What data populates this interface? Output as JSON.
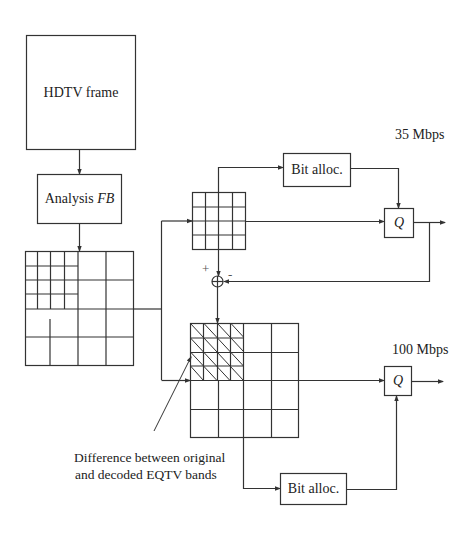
{
  "diagram": {
    "nodes": {
      "hdtv_frame": {
        "label": "HDTV frame"
      },
      "analysis_fb": {
        "label_prefix": "Analysis ",
        "label_math": "FB"
      },
      "bit_alloc_top": {
        "label": "Bit alloc."
      },
      "bit_alloc_bottom": {
        "label": "Bit alloc."
      },
      "q_top": {
        "label": "Q"
      },
      "q_bottom": {
        "label": "Q"
      },
      "sum_junction": {
        "plus": "+",
        "minus": "-"
      }
    },
    "rates": {
      "top": "35 Mbps",
      "bottom": "100 Mbps"
    },
    "annotation": {
      "line1": "Difference between original",
      "line2": "and decoded EQTV bands"
    },
    "colors": {
      "line": "#333333",
      "background": "#ffffff"
    }
  }
}
